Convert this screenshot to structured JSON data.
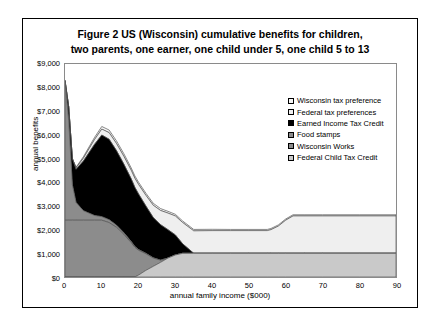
{
  "title_line1": "Figure 2   US (Wisconsin) cumulative benefits for children,",
  "title_line2": "two parents, one earner, one child under 5, one child 5 to 13",
  "chart_data": {
    "type": "area",
    "stacked": true,
    "title": "Figure 2   US (Wisconsin) cumulative benefits for children, two parents, one earner, one child under 5, one child 5 to 13",
    "xlabel": "annual family income ($000)",
    "ylabel": "annual benefits",
    "xlim": [
      0,
      90
    ],
    "ylim": [
      0,
      9000
    ],
    "xticks": [
      0,
      10,
      20,
      30,
      40,
      50,
      60,
      70,
      80,
      90
    ],
    "xticklabels": [
      "0",
      "10",
      "20",
      "30",
      "40",
      "50",
      "60",
      "70",
      "80",
      "90"
    ],
    "yticks": [
      0,
      1000,
      2000,
      3000,
      4000,
      5000,
      6000,
      7000,
      8000,
      9000
    ],
    "yticklabels": [
      "$0",
      "$1,000",
      "$2,000",
      "$3,000",
      "$4,000",
      "$5,000",
      "$6,000",
      "$7,000",
      "$8,000",
      "$9,000"
    ],
    "grid": false,
    "legend_position": "inside-upper-right",
    "x": [
      0,
      1,
      2,
      3,
      5,
      8,
      10,
      12,
      14,
      16,
      18,
      19,
      20,
      22,
      24,
      26,
      28,
      30,
      32,
      35,
      40,
      45,
      50,
      55,
      56,
      58,
      60,
      62,
      65,
      70,
      80,
      90
    ],
    "series": [
      {
        "name": "Federal Child Tax Credit",
        "color": "#c9c9c9",
        "swatch": "light-gray",
        "values": [
          0,
          0,
          0,
          0,
          0,
          0,
          0,
          0,
          0,
          0,
          0,
          0,
          80,
          280,
          450,
          620,
          800,
          930,
          1000,
          1000,
          1000,
          1000,
          1000,
          1000,
          1000,
          1000,
          1000,
          1000,
          1000,
          1000,
          1000,
          1000
        ]
      },
      {
        "name": "Wisconsin Works",
        "color": "#8c8c8c",
        "swatch": "medium-gray",
        "values": [
          2400,
          2400,
          2400,
          2400,
          2400,
          2400,
          2400,
          2300,
          2100,
          1800,
          1450,
          1250,
          1050,
          700,
          350,
          90,
          0,
          0,
          0,
          0,
          0,
          0,
          0,
          0,
          0,
          0,
          0,
          0,
          0,
          0,
          0,
          0
        ]
      },
      {
        "name": "Food stamps",
        "color": "#8c8c8c",
        "swatch": "medium-gray",
        "values": [
          5900,
          4200,
          1500,
          750,
          400,
          200,
          150,
          120,
          90,
          70,
          50,
          40,
          30,
          20,
          10,
          0,
          0,
          0,
          0,
          0,
          0,
          0,
          0,
          0,
          0,
          0,
          0,
          0,
          0,
          0,
          0,
          0
        ]
      },
      {
        "name": "Earned Income Tax Credit",
        "color": "#000000",
        "swatch": "black",
        "values": [
          0,
          600,
          1100,
          1400,
          2100,
          3000,
          3450,
          3400,
          3150,
          2900,
          2650,
          2500,
          2350,
          2000,
          1700,
          1500,
          1200,
          850,
          400,
          0,
          0,
          0,
          0,
          0,
          0,
          0,
          0,
          0,
          0,
          0,
          0,
          0
        ]
      },
      {
        "name": "Federal tax preferences",
        "color": "#efefef",
        "swatch": "white",
        "values": [
          0,
          0,
          0,
          60,
          120,
          200,
          250,
          280,
          300,
          330,
          360,
          380,
          400,
          450,
          520,
          600,
          700,
          800,
          900,
          950,
          960,
          960,
          960,
          960,
          1000,
          1150,
          1400,
          1580,
          1580,
          1580,
          1580,
          1580
        ]
      },
      {
        "name": "Wisconsin tax preference",
        "color": "#f7f7f7",
        "swatch": "white",
        "values": [
          0,
          0,
          0,
          30,
          60,
          90,
          110,
          110,
          110,
          110,
          100,
          100,
          95,
          90,
          85,
          80,
          75,
          70,
          65,
          60,
          55,
          50,
          50,
          50,
          50,
          50,
          50,
          50,
          50,
          50,
          50,
          50
        ]
      }
    ],
    "legend_entries": [
      "Wisconsin tax preference",
      "Federal tax preferences",
      "Earned Income Tax Credit",
      "Food stamps",
      "Wisconsin Works",
      "Federal Child Tax Credit"
    ]
  }
}
